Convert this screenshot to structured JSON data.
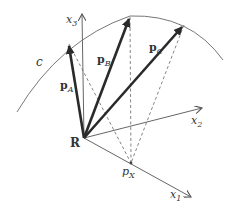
{
  "diagram": {
    "type": "vector-geometry",
    "labels": {
      "curve": "c",
      "origin": "R",
      "axis_x1": "x",
      "axis_x1_sub": "1",
      "axis_x2": "x",
      "axis_x2_sub": "2",
      "axis_x3": "x",
      "axis_x3_sub": "3",
      "vec_a": "p",
      "vec_a_sub": "A",
      "vec_b": "p",
      "vec_b_sub": "B",
      "vec_c": "p",
      "vec_c_sub": "C",
      "point_px": "p",
      "point_px_sub": "X"
    },
    "colors": {
      "vector": "#2a2a2a",
      "axis": "#666666",
      "curve": "#777777",
      "dashed": "#777777"
    }
  }
}
